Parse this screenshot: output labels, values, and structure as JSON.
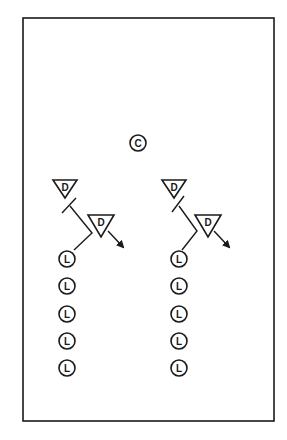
{
  "diagram": {
    "type": "drill-diagram",
    "field": {
      "x": 23,
      "y": 18,
      "width": 251,
      "height": 403,
      "stroke": "#1a1a1a"
    },
    "legend_letters": {
      "coach": "C",
      "defender": "D",
      "line_player": "L"
    },
    "coach": {
      "label": "C",
      "x": 138,
      "y": 143,
      "r": 8
    },
    "groups": [
      {
        "name": "left",
        "defenders": [
          {
            "label": "D",
            "cx": 65,
            "top": 180,
            "half_width": 12,
            "apex": 198
          },
          {
            "label": "D",
            "cx": 101,
            "top": 215,
            "half_width": 13,
            "apex": 237
          }
        ],
        "cut_path": [
          [
            70,
            206
          ],
          [
            92,
            233
          ],
          [
            74,
            250
          ]
        ],
        "screen_mark": [
          [
            62,
            213
          ],
          [
            76,
            198
          ]
        ],
        "arrow": {
          "from": [
            108,
            231
          ],
          "to": [
            123,
            247
          ]
        },
        "line_players": [
          {
            "label": "L",
            "x": 67,
            "y": 259
          },
          {
            "label": "L",
            "x": 67,
            "y": 286
          },
          {
            "label": "L",
            "x": 67,
            "y": 314
          },
          {
            "label": "L",
            "x": 67,
            "y": 341
          },
          {
            "label": "L",
            "x": 67,
            "y": 368
          }
        ]
      },
      {
        "name": "right",
        "defenders": [
          {
            "label": "D",
            "cx": 174,
            "top": 180,
            "half_width": 12,
            "apex": 198
          },
          {
            "label": "D",
            "cx": 208,
            "top": 215,
            "half_width": 13,
            "apex": 237
          }
        ],
        "cut_path": [
          [
            179,
            206
          ],
          [
            197,
            231
          ],
          [
            182,
            250
          ]
        ],
        "screen_mark": [
          [
            172,
            212
          ],
          [
            184,
            196
          ]
        ],
        "arrow": {
          "from": [
            214,
            231
          ],
          "to": [
            229,
            247
          ]
        },
        "line_players": [
          {
            "label": "L",
            "x": 179,
            "y": 259
          },
          {
            "label": "L",
            "x": 179,
            "y": 286
          },
          {
            "label": "L",
            "x": 179,
            "y": 314
          },
          {
            "label": "L",
            "x": 179,
            "y": 341
          },
          {
            "label": "L",
            "x": 179,
            "y": 368
          }
        ]
      }
    ],
    "player_radius": 8,
    "colors": {
      "ink": "#1a1a1a",
      "background": "#ffffff"
    }
  }
}
